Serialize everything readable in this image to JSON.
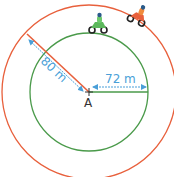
{
  "diagram": {
    "center_label": "A",
    "outer_radius_label": "80 m",
    "inner_radius_label": "72 m",
    "outer_track": {
      "color": "#e8603c",
      "radius_m": 80
    },
    "inner_track": {
      "color": "#4a9a4a",
      "radius_m": 72
    },
    "dimension_color": "#4a9fd8",
    "riders": [
      {
        "name": "green-rider",
        "track": "inner",
        "color": "#5cb85c"
      },
      {
        "name": "orange-rider",
        "track": "outer",
        "color": "#f08a3c"
      }
    ]
  }
}
